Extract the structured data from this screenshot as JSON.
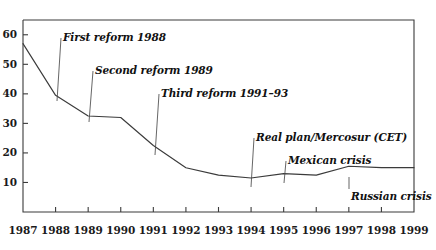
{
  "chart_data": {
    "type": "line",
    "title": "",
    "subtitle": "",
    "xlabel": "",
    "ylabel": "",
    "x": [
      1987,
      1988,
      1989,
      1990,
      1991,
      1992,
      1993,
      1994,
      1995,
      1996,
      1997,
      1998,
      1999
    ],
    "values": [
      57,
      39.5,
      32.5,
      32,
      22.5,
      15,
      12.5,
      11.5,
      13,
      12.5,
      15.5,
      15,
      15
    ],
    "series": [
      {
        "name": "Average tariff rate",
        "values": [
          57,
          39.5,
          32.5,
          32,
          22.5,
          15,
          12.5,
          11.5,
          13,
          12.5,
          15.5,
          15,
          15
        ]
      }
    ],
    "categories": [
      "1987",
      "1988",
      "1989",
      "1990",
      "1991",
      "1992",
      "1993",
      "1994",
      "1995",
      "1996",
      "1997",
      "1998",
      "1999"
    ],
    "xlim": [
      1987,
      1999
    ],
    "ylim": [
      0,
      65
    ],
    "y_ticks": [
      10,
      20,
      30,
      40,
      50,
      60
    ],
    "y_tick_labels": [
      "10",
      "20",
      "30",
      "40",
      "50",
      "60"
    ],
    "x_ticks": [
      1987,
      1988,
      1989,
      1990,
      1991,
      1992,
      1993,
      1994,
      1995,
      1996,
      1997,
      1998,
      1999
    ],
    "x_tick_labels": [
      "1987",
      "1988",
      "1989",
      "1990",
      "1991",
      "1992",
      "1993",
      "1994",
      "1995",
      "1996",
      "1997",
      "1998",
      "1999"
    ],
    "grid": false,
    "legend": null,
    "legend_position": "none",
    "line_color": "#3b3b3b",
    "axis_color": "#3b3b3b",
    "background_color": "#ffffff",
    "annotations": [
      {
        "id": "first-reform",
        "text": "First reform 1988",
        "label_x": 63,
        "label_y": 32,
        "leader_from_x": 61,
        "leader_from_y": 38,
        "leader_to_x": 57,
        "leader_to_y": 101,
        "target_year": 1988,
        "target_value": 39.5
      },
      {
        "id": "second-reform",
        "text": "Second reform 1989",
        "label_x": 95,
        "label_y": 65,
        "leader_from_x": 93,
        "leader_from_y": 71,
        "leader_to_x": 89,
        "leader_to_y": 122,
        "target_year": 1989,
        "target_value": 32.5
      },
      {
        "id": "third-reform",
        "text": "Third reform 1991–93",
        "label_x": 161,
        "label_y": 88,
        "leader_from_x": 159,
        "leader_from_y": 94,
        "leader_to_x": 155,
        "leader_to_y": 155,
        "target_year": 1991,
        "target_value": 22.5
      },
      {
        "id": "real-plan-mercosur",
        "text": "Real plan/Mercosur (CET)",
        "label_x": 256,
        "label_y": 132,
        "leader_from_x": 254,
        "leader_from_y": 138,
        "leader_to_x": 251,
        "leader_to_y": 187,
        "target_year": 1994,
        "target_value": 11.5
      },
      {
        "id": "mexican-crisis",
        "text": "Mexican crisis",
        "label_x": 288,
        "label_y": 155,
        "leader_from_x": 286,
        "leader_from_y": 161,
        "leader_to_x": 284,
        "leader_to_y": 183,
        "target_year": 1995,
        "target_value": 13
      },
      {
        "id": "russian-crisis",
        "text": "Russian crisis",
        "label_x": 351,
        "label_y": 191,
        "leader_from_x": 349,
        "leader_from_y": 189,
        "leader_to_x": 349,
        "leader_to_y": 177,
        "target_year": 1997,
        "target_value": 15.5
      }
    ]
  },
  "axes": {
    "plot_left": 23,
    "plot_right": 414,
    "plot_top": 20,
    "plot_bottom": 212
  }
}
